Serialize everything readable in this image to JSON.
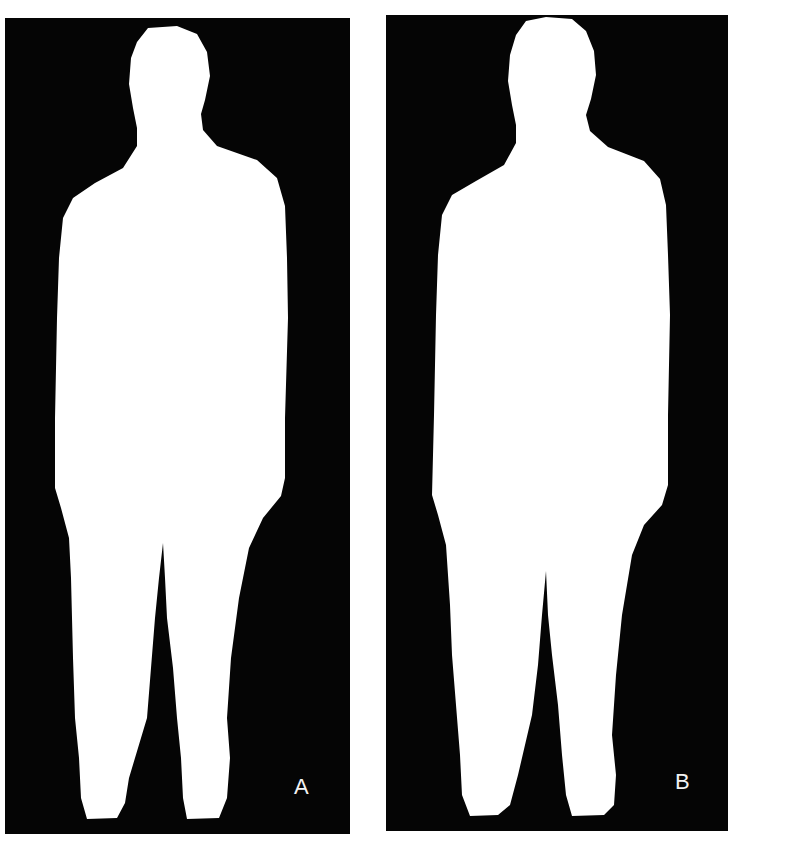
{
  "figure": {
    "panels": [
      {
        "label": "A",
        "content": "binary-silhouette-standing-person"
      },
      {
        "label": "B",
        "content": "binary-silhouette-standing-person"
      }
    ],
    "colors": {
      "background": "#050505",
      "foreground": "#ffffff",
      "page": "#ffffff"
    }
  }
}
